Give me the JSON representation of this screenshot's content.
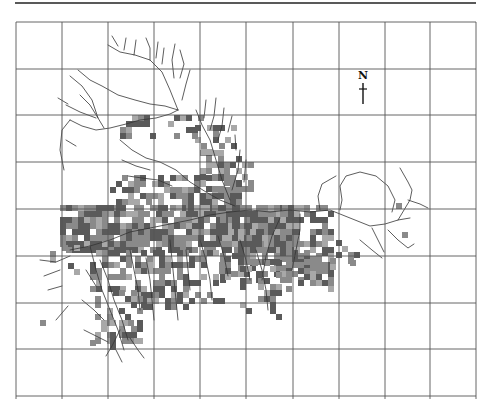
{
  "figure": {
    "north_label": "N",
    "colors": {
      "grid": "#555555",
      "rule": "#222222",
      "river": "#333333",
      "cell_dark": "#5a5a5a",
      "cell_mid": "#8a8a8a",
      "cell_light": "#a8a8a8"
    },
    "grid": {
      "x": [
        16,
        62,
        108,
        154,
        200,
        246,
        293,
        339,
        385,
        430,
        476
      ],
      "y": [
        22,
        69,
        115,
        162,
        209,
        256,
        303,
        349,
        396
      ]
    },
    "cell_size": 6
  }
}
